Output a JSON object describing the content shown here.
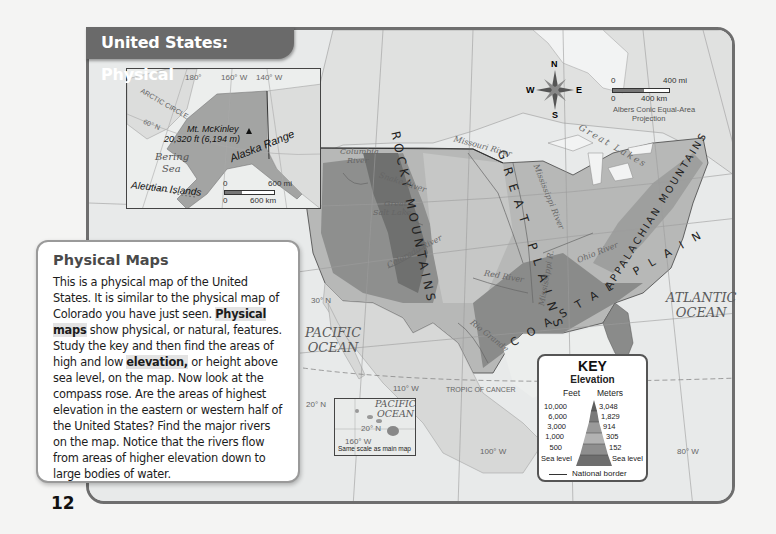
{
  "page": {
    "page_number": "12"
  },
  "map": {
    "title": "United States: Physical",
    "projection": "Albers Conic Equal-Area Projection",
    "projection_line1": "Albers Conic Equal-Area",
    "projection_line2": "Projection",
    "compass": {
      "n": "N",
      "s": "S",
      "e": "E",
      "w": "W"
    },
    "scale": {
      "mi_zero": "0",
      "mi_label": "400 mi",
      "km_zero": "0",
      "km_label": "400 km"
    },
    "mountains": {
      "rocky": "ROCKY MOUNTAINS",
      "appalachian": "APPALACHIAN MOUNTAINS",
      "great_plains": "GREAT PLAINS",
      "coastal_plain": "COASTAL PLAIN"
    },
    "rivers": {
      "columbia": "Columbia River",
      "columbia_line1": "Columbia",
      "columbia_line2": "River",
      "snake": "Snake River",
      "missouri": "Missouri River",
      "mississippi": "Mississippi River",
      "mississippi_r": "Mississippi R.",
      "ohio": "Ohio River",
      "colorado": "Colorado River",
      "red": "Red River",
      "rio_grande": "Rio Grande"
    },
    "water": {
      "great_salt_lake_1": "Great",
      "great_salt_lake_2": "Salt Lake",
      "great_lakes": "Great Lakes",
      "pacific_1": "PACIFIC",
      "pacific_2": "OCEAN",
      "atlantic_1": "ATLANTIC",
      "atlantic_2": "OCEAN"
    },
    "grid": {
      "lat30": "30° N",
      "lat20": "20° N",
      "lon110": "110° W",
      "lon100": "100° W",
      "lon80": "80° W",
      "tropic": "TROPIC OF CANCER"
    },
    "alaska_inset": {
      "lon180": "180°",
      "lon160": "160° W",
      "lon140": "140° W",
      "arctic_circle": "ARCTIC CIRCLE",
      "lat60": "60° N",
      "peak_name": "Mt. McKinley",
      "peak_elev": "20,320 ft (6,194 m)",
      "range": "Alaska Range",
      "sea_1": "Bering",
      "sea_2": "Sea",
      "islands": "Aleutian Islands",
      "scale_mi_zero": "0",
      "scale_mi": "600 mi",
      "scale_km_zero": "0",
      "scale_km": "600 km"
    },
    "hawaii_inset": {
      "ocean_1": "PACIFIC",
      "ocean_2": "OCEAN",
      "lat": "20° N",
      "lon": "160° W",
      "note": "Same scale as main map"
    }
  },
  "key": {
    "title": "KEY",
    "subtitle": "Elevation",
    "feet_header": "Feet",
    "meters_header": "Meters",
    "levels": [
      {
        "feet": "10,000",
        "meters": "3,048",
        "shade": "#5e5e5e"
      },
      {
        "feet": "6,000",
        "meters": "1,829",
        "shade": "#7a7a7a"
      },
      {
        "feet": "3,000",
        "meters": "914",
        "shade": "#9a9a9a"
      },
      {
        "feet": "1,000",
        "meters": "305",
        "shade": "#b2b2b2"
      },
      {
        "feet": "500",
        "meters": "152",
        "shade": "#8e8e8e"
      },
      {
        "feet": "Sea level",
        "meters": "Sea level",
        "shade": "#6e6e6e"
      }
    ],
    "border_label": "National border"
  },
  "sidebar": {
    "heading": "Physical Maps",
    "p1": "This is a physical map of the United States. It is similar to the physical map of Colorado you have just seen. ",
    "term1": "Physical maps",
    "p2": " show physical, or natural, features. Study the key and then find the areas of high and low ",
    "term2": "elevation,",
    "p3": " or height above sea level, on the map. Now look at the compass rose. Are the areas of highest elevation in the eastern or western half of the United States? Find the major rivers on the map. Notice that the rivers flow from areas of higher elevation down to large bodies of water."
  }
}
